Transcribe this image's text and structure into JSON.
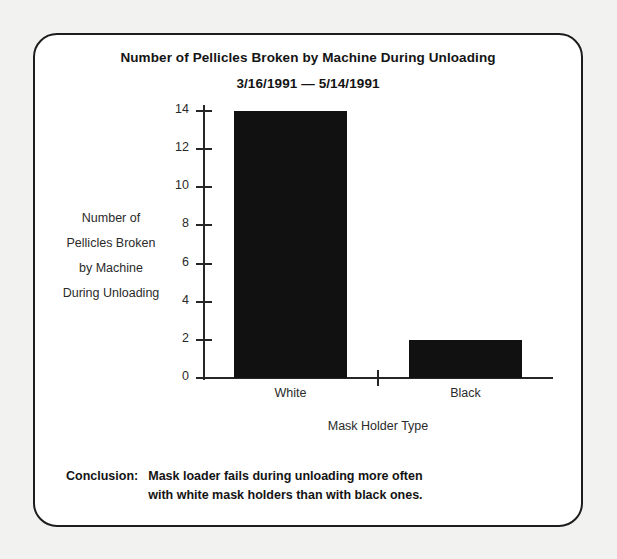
{
  "figure": {
    "frame_border_color": "#1d1d1d",
    "background_color": "#f2f2f0",
    "panel_color": "#ffffff"
  },
  "chart_data": {
    "type": "bar",
    "title": "Number of Pellicles Broken by Machine During Unloading",
    "subtitle": "3/16/1991 — 5/14/1991",
    "categories": [
      "White",
      "Black"
    ],
    "values": [
      14,
      2
    ],
    "xlabel": "Mask Holder Type",
    "ylabel": "Number of Pellicles Broken by Machine During Unloading",
    "ylabel_lines": [
      "Number of",
      "Pellicles Broken",
      "by Machine",
      "During Unloading"
    ],
    "ylim": [
      0,
      14
    ],
    "yticks": [
      0,
      2,
      4,
      6,
      8,
      10,
      12,
      14
    ],
    "ytick_labels": [
      "0",
      "2",
      "4",
      "6",
      "8",
      "10",
      "12",
      "14"
    ],
    "grid": false,
    "legend": false,
    "bar_color": "#111111"
  },
  "conclusion": {
    "label": "Conclusion:",
    "line1": "Mask loader fails during unloading more often",
    "line2": "with white mask holders than with black ones."
  }
}
